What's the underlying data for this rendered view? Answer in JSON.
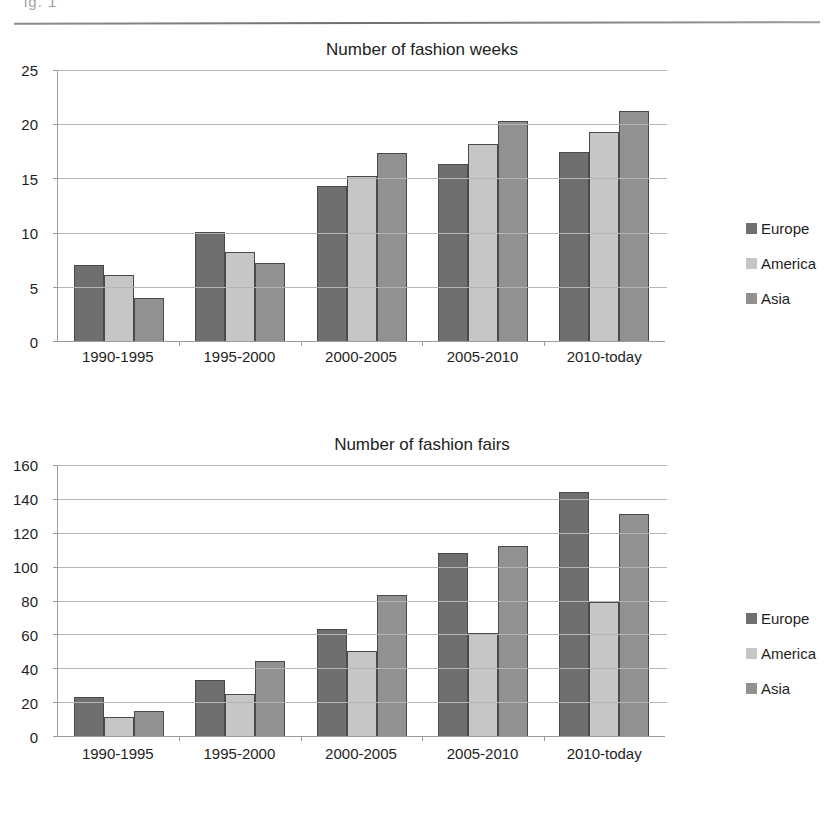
{
  "page": {
    "scan_fragment": "ig. 1",
    "horizontal_rule": "divider"
  },
  "charts": [
    {
      "id": "fashion-weeks",
      "title": "Number of fashion weeks",
      "y_ticks": [
        0,
        5,
        10,
        15,
        20,
        25
      ],
      "legend": [
        {
          "label": "Europe",
          "color": "#6f6f6f"
        },
        {
          "label": "America",
          "color": "#c6c6c6"
        },
        {
          "label": "Asia",
          "color": "#919191"
        }
      ]
    },
    {
      "id": "fashion-fairs",
      "title": "Number of fashion fairs",
      "y_ticks": [
        0,
        20,
        40,
        60,
        80,
        100,
        120,
        140,
        160
      ],
      "legend": [
        {
          "label": "Europe",
          "color": "#6f6f6f"
        },
        {
          "label": "America",
          "color": "#c6c6c6"
        },
        {
          "label": "Asia",
          "color": "#919191"
        }
      ]
    }
  ],
  "chart_data": [
    {
      "type": "bar",
      "title": "Number of fashion weeks",
      "xlabel": "",
      "ylabel": "",
      "categories": [
        "1990-1995",
        "1995-2000",
        "2000-2005",
        "2005-2010",
        "2010-today"
      ],
      "series": [
        {
          "name": "Europe",
          "color": "#6f6f6f",
          "values": [
            7.0,
            10.1,
            14.3,
            16.3,
            17.4
          ]
        },
        {
          "name": "America",
          "color": "#c6c6c6",
          "values": [
            6.1,
            8.2,
            15.2,
            18.2,
            19.3
          ]
        },
        {
          "name": "Asia",
          "color": "#919191",
          "values": [
            4.0,
            7.2,
            17.3,
            20.3,
            21.2
          ]
        }
      ],
      "ylim": [
        0,
        25
      ],
      "ytick_step": 5,
      "grid": true,
      "legend_position": "right"
    },
    {
      "type": "bar",
      "title": "Number of fashion fairs",
      "xlabel": "",
      "ylabel": "",
      "categories": [
        "1990-1995",
        "1995-2000",
        "2000-2005",
        "2005-2010",
        "2010-today"
      ],
      "series": [
        {
          "name": "Europe",
          "color": "#6f6f6f",
          "values": [
            23,
            33,
            63,
            108,
            144
          ]
        },
        {
          "name": "America",
          "color": "#c6c6c6",
          "values": [
            11,
            25,
            50,
            61,
            79
          ]
        },
        {
          "name": "Asia",
          "color": "#919191",
          "values": [
            15,
            44,
            83,
            112,
            131
          ]
        }
      ],
      "ylim": [
        0,
        160
      ],
      "ytick_step": 20,
      "grid": true,
      "legend_position": "right"
    }
  ]
}
